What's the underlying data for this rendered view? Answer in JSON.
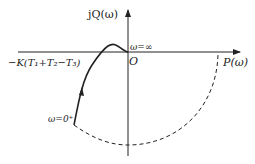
{
  "diagram": {
    "type": "nyquist-plot",
    "axes": {
      "imag_label": "jQ(ω)",
      "real_label": "P(ω)",
      "origin_label": "O"
    },
    "annotations": {
      "omega_inf": "ω=∞",
      "omega_zero": "ω=0⁺",
      "intercept": "−K(T₁+T₂−T₃)"
    },
    "colors": {
      "line": "#222222",
      "background": "#ffffff"
    }
  }
}
